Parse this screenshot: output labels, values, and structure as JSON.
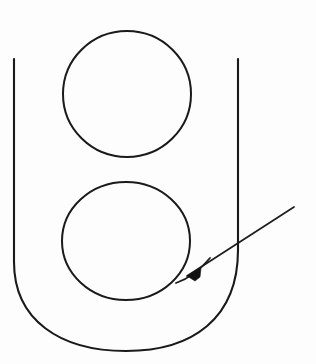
{
  "figure": {
    "background_color": "#fdfdfd",
    "ink_color": "#1a1a1a",
    "canvas": {
      "width": 316,
      "height": 364
    },
    "elements": {
      "left_wall": {
        "name": "left vertical wall",
        "x": 14,
        "y_top": 59,
        "y_bottom": 262,
        "stroke_width": 2.1
      },
      "right_wall": {
        "name": "right vertical wall",
        "x": 238,
        "y_top": 59,
        "y_bottom": 250,
        "stroke_width": 2.1
      },
      "outer_bottom_curve": {
        "name": "outer U bottom curve",
        "path": "M 14 262 C 14 320 60 351 126 351 C 193 351 238 318 238 250",
        "stroke_width": 2.1
      },
      "upper_circle": {
        "name": "upper circle",
        "cx": 127,
        "cy": 94,
        "rx": 64,
        "ry": 63,
        "stroke_width": 2.0
      },
      "lower_circle": {
        "name": "lower circle",
        "cx": 126,
        "cy": 241,
        "rx": 64,
        "ry": 59,
        "stroke_width": 2.0
      },
      "inner_fillet_curve": {
        "name": "inner fillet curve at lower right",
        "path": "M 176 283 C 188 279 200 270 210 258",
        "stroke_width": 1.8
      },
      "leader_arrow": {
        "name": "leader arrow",
        "tail_x": 294,
        "tail_y": 207,
        "tip_x": 187,
        "tip_y": 276,
        "stroke_width": 1.7,
        "arrowhead": {
          "name": "arrowhead",
          "shape": "filled triangle",
          "points": "187,276 201,268 200,277 195,281"
        }
      }
    }
  }
}
